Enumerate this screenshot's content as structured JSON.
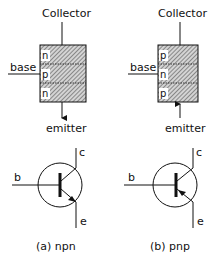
{
  "diagram": {
    "npn": {
      "collector_label": "Collector",
      "base_label": "base",
      "emitter_label": "emitter",
      "layers": [
        "n",
        "p",
        "n"
      ],
      "symbol": {
        "c": "c",
        "b": "b",
        "e": "e",
        "arrow": "outward"
      },
      "caption": "(a) npn"
    },
    "pnp": {
      "collector_label": "Collector",
      "base_label": "base",
      "emitter_label": "emitter",
      "layers": [
        "p",
        "n",
        "p"
      ],
      "symbol": {
        "c": "c",
        "b": "b",
        "e": "e",
        "arrow": "inward"
      },
      "caption": "(b) pnp"
    }
  },
  "colors": {
    "ink": "#111111",
    "hatch_fill": "#9a9a9a",
    "background": "#ffffff"
  }
}
